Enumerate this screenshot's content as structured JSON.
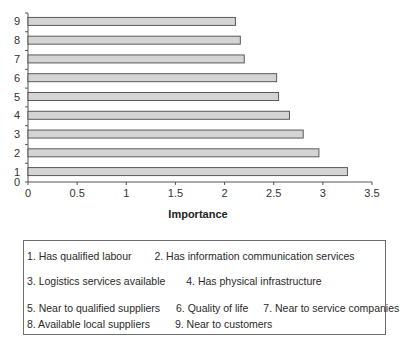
{
  "chart_data": {
    "type": "bar",
    "orientation": "horizontal",
    "title": "",
    "xlabel": "Importance",
    "ylabel": "",
    "categories": [
      "1",
      "2",
      "3",
      "4",
      "5",
      "6",
      "7",
      "8",
      "9"
    ],
    "values": [
      3.25,
      2.96,
      2.8,
      2.66,
      2.55,
      2.53,
      2.2,
      2.16,
      2.11
    ],
    "xlim": [
      0,
      3.5
    ],
    "xticks": [
      "0",
      "0.5",
      "1",
      "1.5",
      "2",
      "2.5",
      "3",
      "3.5"
    ],
    "yticks": [
      "0",
      "1",
      "2",
      "3",
      "4",
      "5",
      "6",
      "7",
      "8",
      "9"
    ],
    "grid": false,
    "bar_color": "#d4d4d4",
    "bar_edge_color": "#4a4a4a",
    "legend_position": "bottom",
    "legend": [
      "1. Has qualified labour",
      "2. Has information communication services",
      "3. Logistics services available",
      "4. Has physical infrastructure",
      "5. Near to qualified suppliers",
      "6. Quality of life",
      "7. Near to service companies",
      "8. Available local suppliers",
      "9. Near to customers"
    ]
  },
  "legend_rows": [
    [
      "1. Has qualified labour",
      "2. Has information communication services"
    ],
    [
      "3. Logistics services available",
      "4. Has physical infrastructure"
    ],
    [
      "5. Near to qualified suppliers",
      "6. Quality of life",
      "7. Near to service companies"
    ],
    [
      "8. Available local suppliers",
      "9. Near to customers"
    ]
  ]
}
